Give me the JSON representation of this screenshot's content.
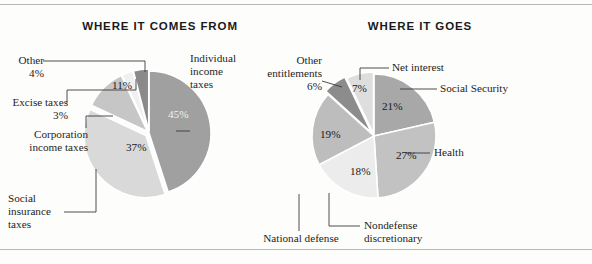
{
  "figure": {
    "background": "#fdfdfc",
    "rule_color": "#b9b9b5"
  },
  "panels": {
    "left": {
      "title": "WHERE IT COMES FROM"
    },
    "right": {
      "title": "WHERE IT GOES"
    }
  },
  "labels": {
    "left": {
      "other": "Other\n4%",
      "excise": "Excise taxes\n3%",
      "corporation": "Corporation\nincome taxes",
      "social_insurance": "Social\ninsurance\ntaxes",
      "individual": "Individual\nincome\ntaxes"
    },
    "right": {
      "other_entitlements": "Other\nentitlements\n6%",
      "net_interest": "Net interest",
      "social_security": "Social Security",
      "health": "Health",
      "nondefense": "Nondefense\ndiscretionary",
      "national_defense": "National defense"
    }
  },
  "pct_labels": {
    "left": {
      "individual": "45%",
      "social_insurance": "37%",
      "corporation": "11%"
    },
    "right": {
      "net_interest": "7%",
      "social_security": "21%",
      "health": "27%",
      "nondefense": "18%",
      "national_defense": "19%"
    }
  },
  "chart_data": [
    {
      "type": "pie",
      "title": "WHERE IT COMES FROM",
      "xlabel": "",
      "ylabel": "",
      "legend_position": "callout-labels",
      "grid": false,
      "start_angle_deg": -90,
      "direction": "clockwise",
      "categories": [
        "Individual income taxes",
        "Social insurance taxes",
        "Corporation income taxes",
        "Excise taxes",
        "Other"
      ],
      "values": [
        45,
        37,
        11,
        3,
        4
      ],
      "value_labels": [
        "45%",
        "37%",
        "11%",
        "3%",
        "4%"
      ],
      "colors": [
        "#a0a0a0",
        "#d9d9d9",
        "#c6c6c6",
        "#f0f0f0",
        "#8a8a8a"
      ]
    },
    {
      "type": "pie",
      "title": "WHERE IT GOES",
      "xlabel": "",
      "ylabel": "",
      "legend_position": "callout-labels",
      "grid": false,
      "start_angle_deg": -90,
      "direction": "clockwise",
      "categories": [
        "Social Security",
        "Health",
        "Nondefense discretionary",
        "National defense",
        "Other entitlements",
        "Net interest"
      ],
      "values": [
        21,
        27,
        18,
        19,
        6,
        7
      ],
      "value_labels": [
        "21%",
        "27%",
        "18%",
        "19%",
        "6%",
        "7%"
      ],
      "colors": [
        "#a8a8a8",
        "#c2c2c2",
        "#ececec",
        "#bdbdbd",
        "#8c8c8c",
        "#dedede"
      ]
    }
  ]
}
